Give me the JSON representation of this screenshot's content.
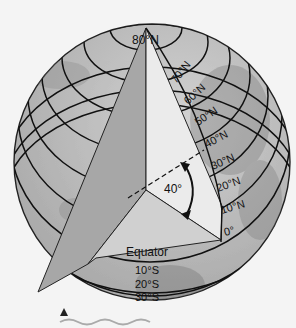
{
  "diagram": {
    "pole_label": "80°N",
    "north_labels": [
      "70°N",
      "60°N",
      "50°N",
      "40°N",
      "30°N",
      "20°N",
      "10°N",
      "0°"
    ],
    "equator_label": "Equator",
    "south_labels": [
      "10°S",
      "20°S",
      "30°S"
    ],
    "angle_label": "40°",
    "colors": {
      "background": "#f4f4f4",
      "globe": "#bdbdbd",
      "wedge_left": "#a6a6a6",
      "wedge_right": "#e9e9e9",
      "wedge_floor": "#cfcfcf",
      "line": "#111111"
    },
    "footer_icons": [
      "triangle-marker-icon",
      "wave-icon"
    ]
  }
}
